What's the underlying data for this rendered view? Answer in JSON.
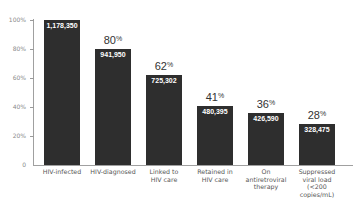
{
  "chart_data": {
    "type": "bar",
    "title": "",
    "xlabel": "",
    "ylabel": "",
    "ylim": [
      0,
      100
    ],
    "yticks": [
      "0",
      "20%",
      "40%",
      "60%",
      "80%",
      "100%"
    ],
    "grid": false,
    "legend": null,
    "categories": [
      "HIV-infected",
      "HIV-diagnosed",
      "Linked to HIV care",
      "Retained in HIV care",
      "On antiretroviral therapy",
      "Suppressed viral load (<200 copies/mL)"
    ],
    "category_display": [
      "HIV-infected",
      "HIV-diagnosed",
      "Linked to\nHIV care",
      "Retained in\nHIV care",
      "On\nantiretroviral\ntherapy",
      "Suppressed\nviral load\n(<200 copies/mL)"
    ],
    "counts": [
      1178350,
      941950,
      725302,
      480395,
      426590,
      328475
    ],
    "count_labels": [
      "1,178,350",
      "941,950",
      "725,302",
      "480,395",
      "426,590",
      "328,475"
    ],
    "values": [
      100,
      80,
      62,
      41,
      36,
      28
    ],
    "percent_labels": [
      "",
      "80",
      "62",
      "41",
      "36",
      "28"
    ],
    "percent_suffix": "%",
    "bar_color": "#2e2e2e"
  }
}
